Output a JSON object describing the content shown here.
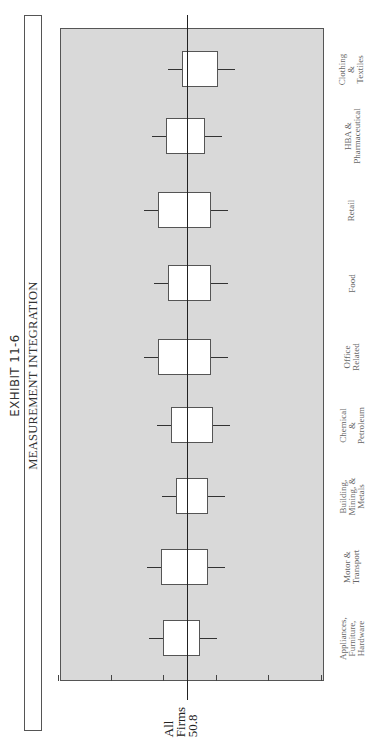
{
  "exhibit_label": "EXHIBIT 11-6",
  "chart_data": {
    "type": "box",
    "orientation": "rotated-90-ccw",
    "title": "MEASUREMENT INTEGRATION",
    "exhibit": "EXHIBIT 11-6",
    "ylabel": "",
    "xlabel": "",
    "ylim": [
      0,
      100
    ],
    "ticks": [
      100,
      80,
      60,
      40,
      20,
      0
    ],
    "grid": false,
    "reference_line": {
      "label_lines": [
        "All",
        "Firms",
        "50.8"
      ],
      "value": 50.8
    },
    "categories": [
      "Appliances, Furniture, Hardware",
      "Motor & Transport",
      "Building, Mining, & Metals",
      "Chemical & Petroleum",
      "Office Related",
      "Food",
      "Retail",
      "HBA & Pharmaceutical",
      "Clothing & Textiles"
    ],
    "series": [
      {
        "name": "high",
        "values": [
          64,
          69,
          68,
          63,
          71,
          71,
          73,
          76,
          59
        ]
      },
      {
        "name": "median",
        "values": [
          53,
          51,
          48,
          49,
          50,
          49,
          52,
          52,
          47
        ]
      },
      {
        "name": "low",
        "values": [
          39,
          29,
          31,
          30,
          25,
          32,
          31,
          38,
          34
        ]
      }
    ],
    "boxes": [
      {
        "category_lines": [
          "Appliances,",
          "Furniture,",
          "Hardware"
        ],
        "high": 64,
        "median": 53,
        "low": 39,
        "box_top": 60,
        "box_bottom": 46,
        "center_y": 638
      },
      {
        "category_lines": [
          "Motor &",
          "Transport"
        ],
        "high": 69,
        "median": 51,
        "low": 29,
        "box_top": 61,
        "box_bottom": 43,
        "center_y": 567
      },
      {
        "category_lines": [
          "Building,",
          "Mining, &",
          "Metals"
        ],
        "high": 68,
        "median": 48,
        "low": 31,
        "box_top": 55,
        "box_bottom": 43,
        "center_y": 496
      },
      {
        "category_lines": [
          "Chemical",
          "&",
          "Petroleum"
        ],
        "high": 63,
        "median": 49,
        "low": 30,
        "box_top": 57,
        "box_bottom": 41,
        "center_y": 425
      },
      {
        "category_lines": [
          "Office",
          "Related"
        ],
        "high": 71,
        "median": 50,
        "low": 25,
        "box_top": 62,
        "box_bottom": 42,
        "center_y": 357
      },
      {
        "category_lines": [
          "Food"
        ],
        "high": 71,
        "median": 49,
        "low": 32,
        "box_top": 58,
        "box_bottom": 42,
        "center_y": 283
      },
      {
        "category_lines": [
          "Retail"
        ],
        "high": 73,
        "median": 52,
        "low": 31,
        "box_top": 62,
        "box_bottom": 42,
        "center_y": 210
      },
      {
        "category_lines": [
          "HBA &",
          "Pharmaceutical"
        ],
        "high": 76,
        "median": 52,
        "low": 38,
        "box_top": 59,
        "box_bottom": 44,
        "center_y": 136
      },
      {
        "category_lines": [
          "Clothing",
          "&",
          "Textiles"
        ],
        "high": 59,
        "median": 47,
        "low": 34,
        "box_top": 53,
        "box_bottom": 39,
        "center_y": 69
      }
    ]
  }
}
